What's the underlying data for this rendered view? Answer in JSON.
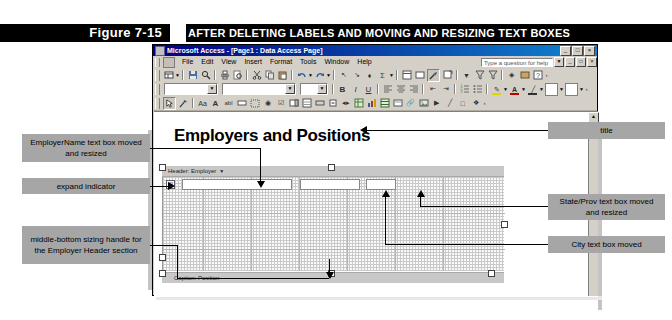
{
  "figure": {
    "label": "Figure 7-15",
    "caption": "AFTER DELETING LABELS AND MOVING AND RESIZING TEXT BOXES"
  },
  "app_window": {
    "title": "Microsoft Access - [Page1 : Data Access Page]",
    "icon": "access-icon",
    "window_buttons": [
      "_",
      "□",
      "×"
    ],
    "mdi_buttons": [
      "_",
      "□",
      "×"
    ],
    "menu": {
      "items": [
        "File",
        "Edit",
        "View",
        "Insert",
        "Format",
        "Tools",
        "Window",
        "Help"
      ],
      "help_search_placeholder": "Type a question for help",
      "help_dropdown_caret": "▼"
    },
    "toolbars": {
      "standard": {
        "name": "Page Design toolbar",
        "buttons": [
          "view-icon",
          "view-dropdown-caret",
          "save-icon",
          "search-icon",
          "print-icon",
          "print-preview-icon",
          "cut-icon",
          "copy-icon",
          "paste-icon",
          "undo-icon",
          "undo-dropdown-caret",
          "redo-icon",
          "redo-dropdown-caret",
          "hyperlink-icon",
          "promote-icon",
          "demote-icon",
          "autosum-icon",
          "autosum-dropdown-caret",
          "field-list-icon",
          "sorting-grouping-icon",
          "toolbox-icon",
          "properties-icon",
          "filter-by-form-icon",
          "filter-by-selection-icon",
          "remove-filter-icon",
          "theme-icon",
          "microsoft-script-editor-icon",
          "help-icon"
        ]
      },
      "formatting": {
        "name": "Formatting toolbar",
        "style_combo_value": "",
        "font_combo_value": "",
        "size_combo_value": "",
        "buttons": [
          "bold-icon",
          "italic-icon",
          "underline-icon",
          "align-left-icon",
          "align-center-icon",
          "align-right-icon",
          "decrease-indent-icon",
          "increase-indent-icon",
          "numbered-list-icon",
          "bulleted-list-icon",
          "highlight-color-icon",
          "font-color-icon",
          "line-color-icon",
          "fill-color-icon",
          "border-color-icon"
        ],
        "bold_label": "B",
        "italic_label": "I",
        "underline_label": "U"
      },
      "toolbox": {
        "name": "Toolbox",
        "buttons": [
          "select-objects-icon",
          "control-wizards-icon",
          "bound-span-icon",
          "label-icon",
          "text-box-icon",
          "scrolling-text-icon",
          "option-group-icon",
          "option-button-icon",
          "check-box-icon",
          "dropdown-list-icon",
          "list-box-icon",
          "command-button-icon",
          "expand-icon",
          "record-navigation-icon",
          "office-pivottable-icon",
          "office-chart-icon",
          "office-spreadsheet-icon",
          "bound-html-icon",
          "hyperlink-icon",
          "image-hyperlink-icon",
          "movie-icon",
          "line-icon",
          "rectangle-icon",
          "more-controls-icon"
        ]
      }
    },
    "page": {
      "heading": "Employers and Positions",
      "expand_indicator_glyph": "⊞",
      "section_header": {
        "label": "Header: Employer",
        "caret": "▼"
      },
      "caption_section": {
        "label": "Caption: Position"
      },
      "text_boxes": [
        {
          "name": "EmployerName",
          "value": ""
        },
        {
          "name": "State/Prov",
          "value": ""
        },
        {
          "name": "City",
          "value": ""
        }
      ],
      "scroll_up_glyph": "▲"
    }
  },
  "callouts": {
    "employername": "EmployerName text box moved and resized",
    "expand": "expand indicator",
    "sizing_handle": "middle-bottom sizing handle for the Employer Header section",
    "title": "title",
    "stateprov": "State/Prov text box moved and resized",
    "city": "City text box moved"
  },
  "colors": {
    "banner_bg": "#000000",
    "banner_text": "#ffffff",
    "callout_bg": "#a6a6a6",
    "window_chrome": "#d4d0c8",
    "titlebar_start": "#000080",
    "titlebar_end": "#1084d0",
    "section_bar": "#c8c8c8",
    "leader_line": "#000000"
  }
}
